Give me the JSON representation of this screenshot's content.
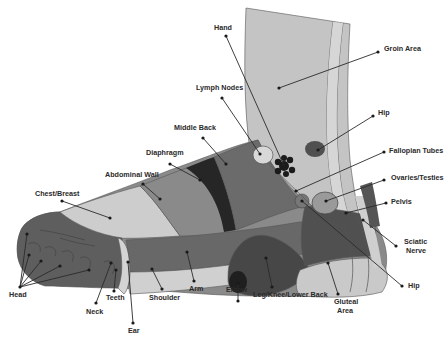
{
  "diagram": {
    "colors": {
      "background": "#ffffff",
      "leg_light": "#c4c4c4",
      "leg_stripe": "#d6d6d6",
      "toes_dark": "#5e5e5e",
      "chest_light": "#cdcdcd",
      "abdominal_mid": "#8a8a8a",
      "diaphragm_black": "#262626",
      "middle_back": "#6b6b6b",
      "arm_band": "#686868",
      "heel_dark": "#474747",
      "shoulder_light": "#d0d0d0",
      "gluteal_light": "#c9c9c9",
      "pelvis_dark": "#505050",
      "hip_oval": "#505050",
      "hand_black": "#1b1b1b",
      "label_text": "#2a2a2a"
    },
    "labels": {
      "hand": "Hand",
      "groin_area": "Groin Area",
      "lymph_nodes": "Lymph Nodes",
      "hip_upper": "Hip",
      "middle_back": "Middle Back",
      "diaphragm": "Diaphragm",
      "fallopian_tubes": "Fallopian Tubes",
      "abdominal_wall": "Abdominal Wall",
      "ovaries_testies": "Ovaries/Testies",
      "chest_breast": "Chest/Breast",
      "pelvis": "Pelvis",
      "sciatic_nerve_1": "Sciatic",
      "sciatic_nerve_2": "Nerve",
      "head": "Head",
      "teeth": "Teeth",
      "neck": "Neck",
      "ear": "Ear",
      "shoulder": "Shoulder",
      "arm": "Arm",
      "elbow": "Elbow",
      "leg_knee_lower_back": "Leg/Knee/Lower Back",
      "gluteal_area_1": "Gluteal",
      "gluteal_area_2": "Area",
      "hip_lower": "Hip"
    }
  }
}
